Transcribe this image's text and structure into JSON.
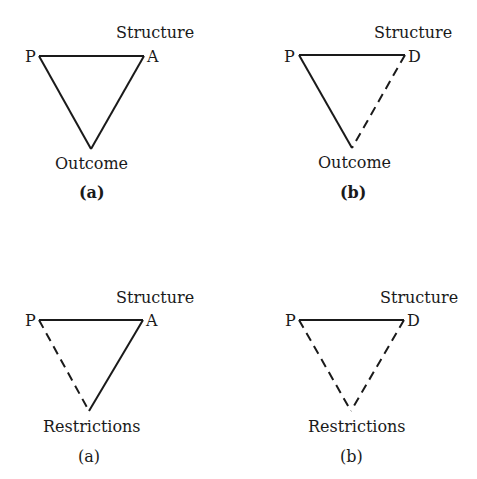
{
  "diagrams": [
    {
      "id": "top-a",
      "caption": "(a)",
      "top_label": "Structure",
      "left_vertex": "P",
      "right_vertex": "A",
      "bottom_label": "Outcome",
      "edges": {
        "top": "solid",
        "left": "solid",
        "right": "solid"
      }
    },
    {
      "id": "top-b",
      "caption": "(b)",
      "top_label": "Structure",
      "left_vertex": "P",
      "right_vertex": "D",
      "bottom_label": "Outcome",
      "edges": {
        "top": "solid",
        "left": "solid",
        "right": "dashed"
      }
    },
    {
      "id": "bottom-a",
      "caption": "(a)",
      "top_label": "Structure",
      "left_vertex": "P",
      "right_vertex": "A",
      "bottom_label": "Restrictions",
      "edges": {
        "top": "solid",
        "left": "dashed",
        "right": "solid"
      }
    },
    {
      "id": "bottom-b",
      "caption": "(b)",
      "top_label": "Structure",
      "left_vertex": "P",
      "right_vertex": "D",
      "bottom_label": "Restrictions",
      "edges": {
        "top": "solid",
        "left": "dashed",
        "right": "dashed"
      }
    }
  ]
}
